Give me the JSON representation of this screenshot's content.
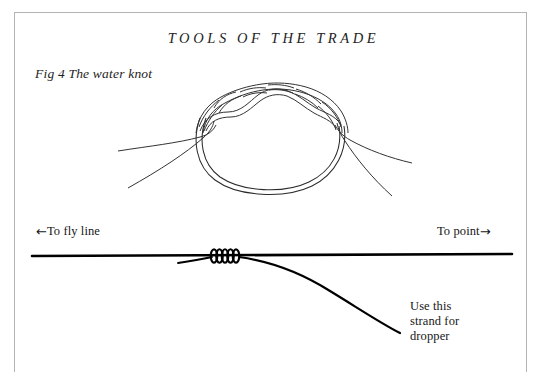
{
  "page": {
    "running_head": "TOOLS OF THE TRADE",
    "background_color": "#ffffff",
    "frame_color": "#b4b4b4",
    "ink_color": "#1a1a1a"
  },
  "figure": {
    "caption": "Fig 4 The water knot"
  },
  "diagram_labels": {
    "left_arrow_glyph": "←",
    "right_arrow_glyph": "→",
    "fly_line": "To fly line",
    "to_point": "To point",
    "dropper_line_1": "Use this",
    "dropper_line_2": "strand for",
    "dropper_line_3": "dropper"
  }
}
